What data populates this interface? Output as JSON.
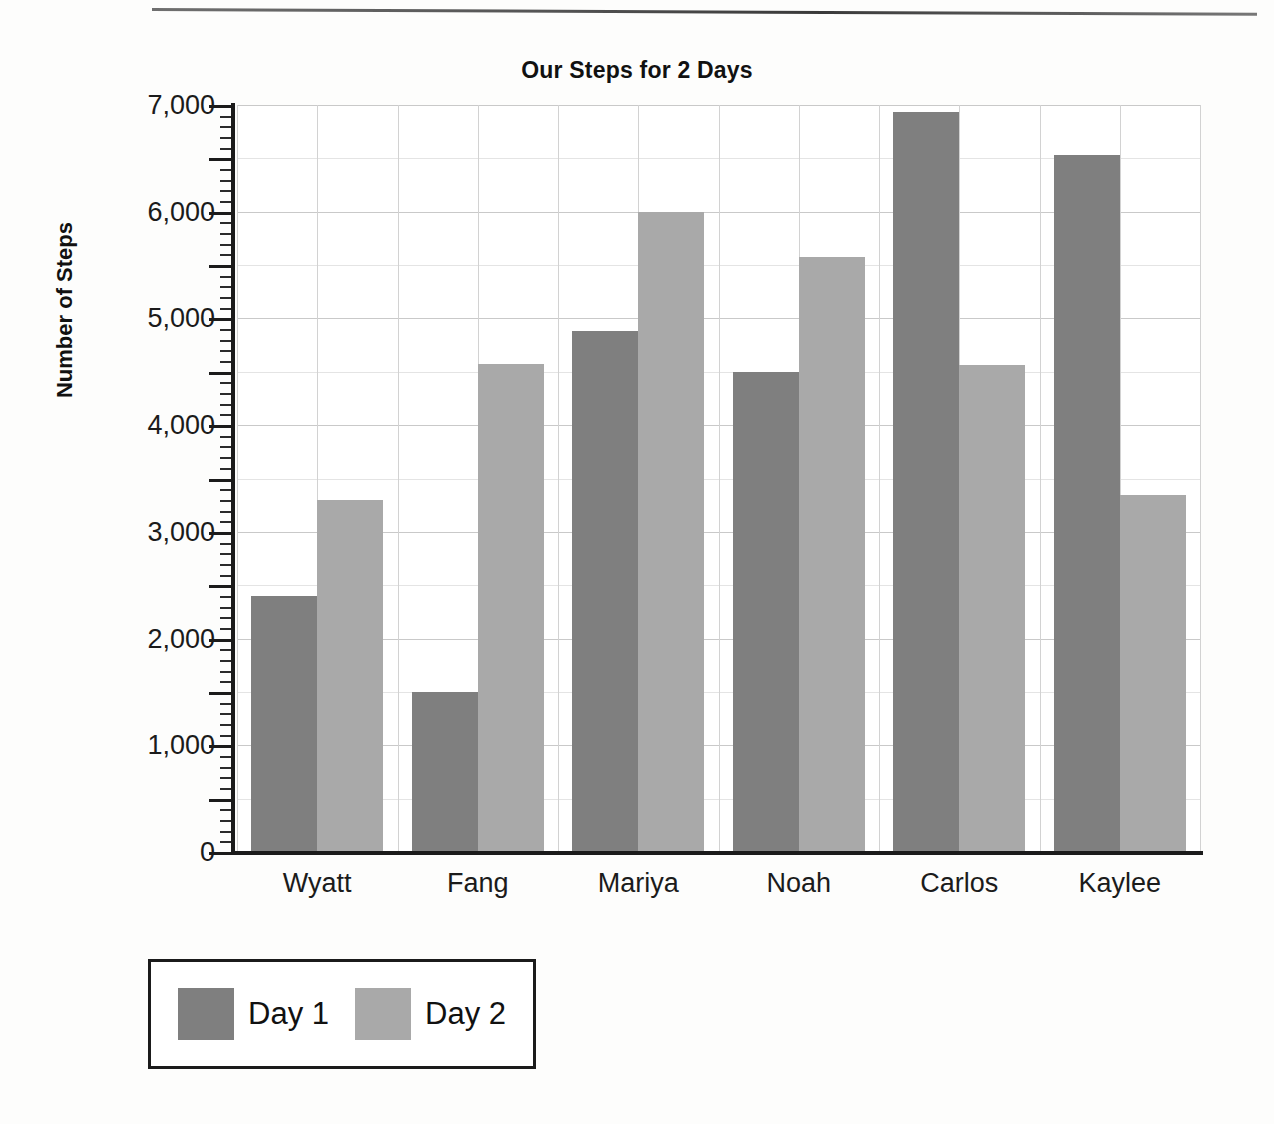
{
  "chart_data": {
    "type": "bar",
    "title": "Our Steps for 2 Days",
    "xlabel": "",
    "ylabel": "Number of Steps",
    "categories": [
      "Wyatt",
      "Fang",
      "Mariya",
      "Noah",
      "Carlos",
      "Kaylee"
    ],
    "series": [
      {
        "name": "Day 1",
        "color": "#7f7f7f",
        "values": [
          2400,
          1500,
          4880,
          4500,
          6930,
          6530
        ]
      },
      {
        "name": "Day 2",
        "color": "#a9a9a9",
        "values": [
          3300,
          4570,
          6000,
          5580,
          4560,
          3350
        ]
      }
    ],
    "ylim": [
      0,
      7000
    ],
    "y_major_step": 1000,
    "y_minor_step": 500,
    "y_tick_labels": [
      "0",
      "1,000",
      "2,000",
      "3,000",
      "4,000",
      "5,000",
      "6,000",
      "7,000"
    ],
    "grid": true,
    "legend_position": "bottom-left"
  },
  "legend": {
    "items": [
      {
        "label": "Day 1",
        "color": "#7f7f7f"
      },
      {
        "label": "Day 2",
        "color": "#a9a9a9"
      }
    ]
  },
  "page": {
    "ghost_text": [
      "",
      "",
      ""
    ]
  }
}
